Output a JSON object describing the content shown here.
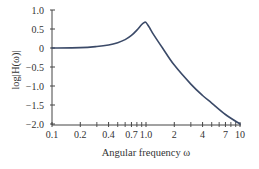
{
  "chart_data": {
    "type": "line",
    "title": "",
    "xlabel": "Angular frequency ω",
    "ylabel": "log|H(ω)|",
    "xscale": "log",
    "xlim": [
      0.1,
      10
    ],
    "ylim": [
      -2.0,
      1.0
    ],
    "grid": false,
    "legend": null,
    "x_ticks": [
      {
        "value": 0.1,
        "label": "0.1"
      },
      {
        "value": 0.2,
        "label": "0.2"
      },
      {
        "value": 0.4,
        "label": "0.4"
      },
      {
        "value": 0.7,
        "label": "0.7"
      },
      {
        "value": 1.0,
        "label": "1.0"
      },
      {
        "value": 2,
        "label": "2"
      },
      {
        "value": 4,
        "label": "4"
      },
      {
        "value": 7,
        "label": "7"
      },
      {
        "value": 10,
        "label": "10"
      }
    ],
    "x_minor_ticks": [
      0.3,
      0.5,
      0.6,
      0.8,
      0.9,
      3,
      5,
      6,
      8,
      9
    ],
    "y_ticks": [
      {
        "value": 1.0,
        "label": "1.0"
      },
      {
        "value": 0.5,
        "label": "0.5"
      },
      {
        "value": 0,
        "label": "0"
      },
      {
        "value": -0.5,
        "label": "−0.5"
      },
      {
        "value": -1.0,
        "label": "−1.0"
      },
      {
        "value": -1.5,
        "label": "−1.5"
      },
      {
        "value": -2.0,
        "label": "−2.0"
      }
    ],
    "series": [
      {
        "name": "log|H(ω)|",
        "color": "#3b4a68",
        "x": [
          0.1,
          0.2,
          0.3,
          0.4,
          0.5,
          0.6,
          0.7,
          0.8,
          0.9,
          0.97,
          1.0,
          1.05,
          1.1,
          1.2,
          1.5,
          2,
          3,
          4,
          5,
          7,
          10
        ],
        "y": [
          0.0,
          0.01,
          0.04,
          0.08,
          0.14,
          0.22,
          0.33,
          0.47,
          0.62,
          0.68,
          0.67,
          0.6,
          0.52,
          0.36,
          0.0,
          -0.45,
          -0.95,
          -1.25,
          -1.45,
          -1.75,
          -2.0
        ]
      }
    ]
  }
}
